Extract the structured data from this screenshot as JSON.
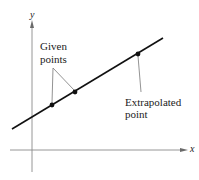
{
  "diagram": {
    "axes": {
      "x_label": "x",
      "y_label": "y"
    },
    "annotations": {
      "given_points": [
        "Given",
        "points"
      ],
      "extrapolated_point": [
        "Extrapolated",
        "point"
      ]
    },
    "elements": {
      "line": {
        "from": [
          12,
          129
        ],
        "to": [
          163,
          38
        ],
        "color": "#111111"
      },
      "given_points": [
        [
          52,
          105
        ],
        [
          75,
          92
        ]
      ],
      "extrapolated_point": [
        138,
        54
      ]
    },
    "colors": {
      "axis": "#888888",
      "line": "#111111",
      "leader": "#777777",
      "text": "#222222"
    }
  }
}
